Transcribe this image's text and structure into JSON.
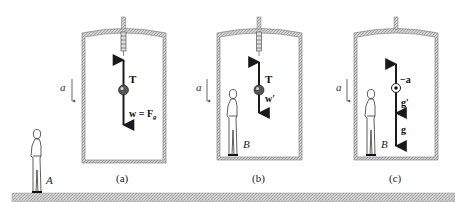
{
  "figure": {
    "panels": [
      {
        "caption": "(a)",
        "accel_label": "a",
        "person_label": "",
        "vectors": {
          "up": "T",
          "down": "w = F",
          "down_sub": "g"
        }
      },
      {
        "caption": "(b)",
        "accel_label": "a",
        "person_label": "B",
        "vectors": {
          "up": "T",
          "down": "w′"
        }
      },
      {
        "caption": "(c)",
        "accel_label": "a",
        "person_label": "B",
        "vectors": {
          "up": "−a",
          "middle": "g′",
          "down": "g"
        }
      }
    ],
    "ground_observer_label": "A"
  },
  "colors": {
    "ink": "#1a1a1a",
    "frame_fill": "#b8b8b8",
    "ground_fill": "#c4c4c4"
  }
}
